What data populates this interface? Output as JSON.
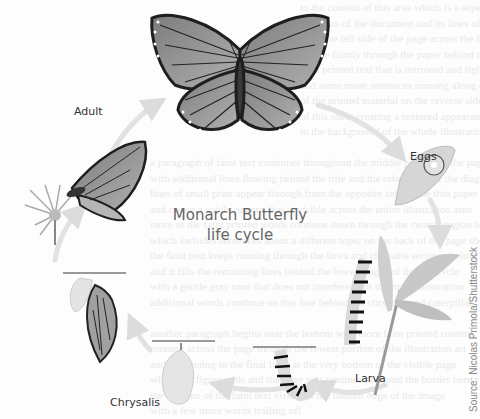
{
  "title": {
    "line1": "Monarch Butterfly",
    "line2": "life cycle"
  },
  "stages": [
    {
      "id": "adult",
      "label": "Adult"
    },
    {
      "id": "eggs",
      "label": "Eggs"
    },
    {
      "id": "larva",
      "label": "Larva"
    },
    {
      "id": "chrysalis",
      "label": "Chrysalis"
    }
  ],
  "credit": "Source: Nicolas Primola/Shutterstock",
  "colors": {
    "wing_fill": "#9a9a9a",
    "wing_vein": "#2b2b2b",
    "arrow": "#e4e4e4",
    "label": "#333333",
    "title": "#666666"
  }
}
